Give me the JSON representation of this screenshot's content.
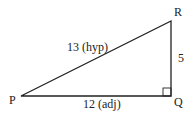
{
  "diagram": {
    "type": "right-triangle",
    "vertices": {
      "P": {
        "label": "P",
        "x": 21,
        "y": 96
      },
      "Q": {
        "label": "Q",
        "x": 171,
        "y": 96
      },
      "R": {
        "label": "R",
        "x": 171,
        "y": 21
      }
    },
    "sides": {
      "hypotenuse": {
        "label": "13 (hyp)",
        "from": "P",
        "to": "R"
      },
      "adjacent": {
        "label": "12 (adj)",
        "from": "P",
        "to": "Q"
      },
      "opposite": {
        "label": "5",
        "from": "Q",
        "to": "R"
      }
    },
    "right_angle_at": "Q",
    "stroke_color": "#222222"
  }
}
